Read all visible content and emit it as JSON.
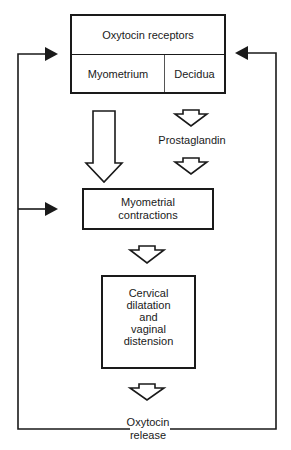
{
  "diagram": {
    "top_box": {
      "title": "Oxytocin receptors",
      "left_cell": "Myometrium",
      "right_cell": "Decidua"
    },
    "intermediate": "Prostaglandin",
    "contractions_box": {
      "line1": "Myometrial",
      "line2": "contractions"
    },
    "cervical_box": {
      "line1": "Cervical",
      "line2": "dilatation",
      "line3": "and",
      "line4": "vaginal",
      "line5": "distension"
    },
    "release": {
      "line1": "Oxytocin",
      "line2": "release"
    },
    "colors": {
      "stroke": "#1a1a1a",
      "background": "#ffffff"
    }
  }
}
